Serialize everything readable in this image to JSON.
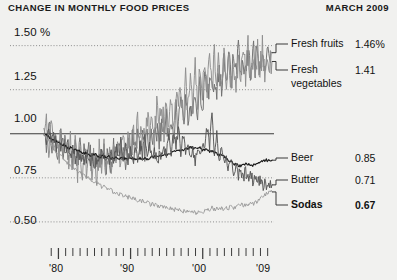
{
  "header": {
    "title": "CHANGE IN MONTHLY FOOD PRICES",
    "date": "MARCH 2009"
  },
  "chart_data": {
    "type": "line",
    "title": "CHANGE IN MONTHLY FOOD PRICES",
    "subtitle": "MARCH 2009",
    "xlabel": "",
    "ylabel": "",
    "grid": true,
    "legend_position": "right",
    "ylim": [
      0.42,
      1.6
    ],
    "yticks": [
      1.5,
      1.25,
      1.0,
      0.75,
      0.5
    ],
    "ytick_labels": [
      "1.50 %",
      "1.25",
      "1.00",
      "0.75",
      "0.50"
    ],
    "xlim": [
      1978,
      2009.6
    ],
    "xticks": [
      1980,
      1990,
      2000,
      2009
    ],
    "xtick_labels": [
      "'80",
      "'90",
      "'00",
      "'09"
    ],
    "baseline": 1.0,
    "series": [
      {
        "name": "Fresh fruits",
        "end_label": "1.46%",
        "end_value": 1.46,
        "color": "#6f6f6f",
        "values": [
          1.03,
          0.96,
          1.04,
          0.92,
          1.0,
          0.93,
          0.86,
          0.97,
          0.88,
          0.95,
          0.86,
          0.93,
          0.86,
          0.93,
          0.85,
          0.92,
          0.84,
          0.91,
          0.83,
          0.9,
          0.82,
          0.89,
          0.81,
          0.88,
          0.83,
          0.9,
          0.82,
          0.89,
          0.83,
          0.92,
          0.84,
          0.93,
          0.85,
          0.94,
          0.86,
          0.95,
          0.87,
          0.96,
          0.88,
          0.97,
          0.9,
          0.99,
          0.91,
          1.0,
          0.93,
          1.02,
          0.94,
          1.03,
          0.96,
          1.05,
          0.98,
          1.07,
          1.0,
          1.1,
          1.02,
          1.12,
          1.05,
          1.15,
          1.07,
          1.17,
          1.1,
          1.2,
          1.12,
          1.23,
          1.15,
          1.26,
          1.17,
          1.29,
          1.19,
          1.31,
          1.22,
          1.34,
          1.24,
          1.37,
          1.27,
          1.4,
          1.29,
          1.43,
          1.32,
          1.45,
          1.34,
          1.47,
          1.3,
          1.44,
          1.33,
          1.46,
          1.36,
          1.5,
          1.38,
          1.52,
          1.35,
          1.48,
          1.38,
          1.51,
          1.41,
          1.46
        ]
      },
      {
        "name": "Fresh vegetables",
        "end_label": "1.41",
        "end_value": 1.41,
        "color": "#8e8e8e",
        "values": [
          0.99,
          1.09,
          0.94,
          1.05,
          0.91,
          1.02,
          0.88,
          0.99,
          0.85,
          0.97,
          0.83,
          0.94,
          0.81,
          0.92,
          0.8,
          0.91,
          0.79,
          0.9,
          0.78,
          0.89,
          0.77,
          0.88,
          0.78,
          0.9,
          0.79,
          0.92,
          0.8,
          0.93,
          0.82,
          0.95,
          0.83,
          0.97,
          0.85,
          0.99,
          0.86,
          1.01,
          0.88,
          1.03,
          0.9,
          1.05,
          0.92,
          1.07,
          0.94,
          1.1,
          0.96,
          1.12,
          0.98,
          1.15,
          1.0,
          1.18,
          1.02,
          1.2,
          1.05,
          1.23,
          1.07,
          1.26,
          1.09,
          1.28,
          1.12,
          1.31,
          1.14,
          1.34,
          1.16,
          1.36,
          1.18,
          1.38,
          1.2,
          1.4,
          1.22,
          1.42,
          1.24,
          1.44,
          1.26,
          1.45,
          1.27,
          1.46,
          1.28,
          1.47,
          1.25,
          1.43,
          1.28,
          1.45,
          1.3,
          1.47,
          1.32,
          1.49,
          1.29,
          1.44,
          1.32,
          1.46,
          1.34,
          1.48,
          1.36,
          1.44,
          1.38,
          1.41
        ]
      },
      {
        "name": "Beer",
        "end_label": "0.85",
        "end_value": 0.85,
        "color": "#1c1c1c",
        "values": [
          1.0,
          0.99,
          0.98,
          0.97,
          0.96,
          0.96,
          0.95,
          0.94,
          0.94,
          0.93,
          0.92,
          0.92,
          0.91,
          0.91,
          0.9,
          0.9,
          0.89,
          0.89,
          0.89,
          0.88,
          0.88,
          0.88,
          0.88,
          0.87,
          0.87,
          0.87,
          0.87,
          0.87,
          0.86,
          0.86,
          0.86,
          0.86,
          0.86,
          0.86,
          0.86,
          0.86,
          0.86,
          0.86,
          0.86,
          0.86,
          0.86,
          0.86,
          0.86,
          0.86,
          0.86,
          0.87,
          0.87,
          0.87,
          0.87,
          0.88,
          0.88,
          0.88,
          0.89,
          0.89,
          0.9,
          0.9,
          0.9,
          0.91,
          0.91,
          0.91,
          0.92,
          0.92,
          0.92,
          0.92,
          0.92,
          0.92,
          0.91,
          0.91,
          0.91,
          0.9,
          0.9,
          0.89,
          0.89,
          0.88,
          0.88,
          0.87,
          0.86,
          0.85,
          0.84,
          0.83,
          0.83,
          0.82,
          0.82,
          0.82,
          0.83,
          0.83,
          0.82,
          0.82,
          0.83,
          0.83,
          0.84,
          0.84,
          0.85,
          0.85,
          0.85,
          0.85
        ]
      },
      {
        "name": "Butter",
        "end_label": "0.71",
        "end_value": 0.71,
        "color": "#555555",
        "values": [
          1.0,
          0.97,
          1.02,
          0.95,
          1.0,
          0.93,
          0.98,
          0.91,
          0.96,
          0.89,
          0.94,
          0.88,
          0.92,
          0.86,
          0.9,
          0.85,
          0.89,
          0.84,
          0.88,
          0.83,
          0.87,
          0.82,
          0.86,
          0.84,
          0.9,
          0.84,
          0.89,
          0.83,
          0.88,
          0.86,
          0.93,
          0.87,
          0.95,
          0.86,
          0.93,
          0.85,
          0.91,
          0.84,
          0.9,
          0.86,
          0.94,
          0.88,
          0.98,
          0.86,
          0.93,
          0.85,
          0.9,
          0.84,
          0.88,
          0.86,
          0.92,
          0.88,
          0.97,
          0.9,
          1.01,
          0.92,
          1.04,
          0.9,
          0.99,
          0.88,
          0.95,
          0.86,
          0.92,
          0.85,
          0.9,
          0.87,
          0.96,
          0.91,
          1.04,
          0.94,
          1.1,
          0.9,
          1.0,
          0.86,
          0.92,
          0.83,
          0.87,
          0.8,
          0.84,
          0.78,
          0.82,
          0.76,
          0.8,
          0.75,
          0.79,
          0.74,
          0.78,
          0.73,
          0.77,
          0.71,
          0.75,
          0.7,
          0.73,
          0.69,
          0.72,
          0.71
        ]
      },
      {
        "name": "Sodas",
        "end_label": "0.67",
        "end_value": 0.67,
        "color": "#9a9a9a",
        "bold": true,
        "values": [
          1.0,
          0.98,
          0.96,
          0.94,
          0.92,
          0.9,
          0.89,
          0.87,
          0.86,
          0.85,
          0.83,
          0.82,
          0.81,
          0.8,
          0.79,
          0.78,
          0.77,
          0.76,
          0.75,
          0.74,
          0.73,
          0.72,
          0.72,
          0.71,
          0.7,
          0.7,
          0.69,
          0.68,
          0.68,
          0.67,
          0.67,
          0.66,
          0.66,
          0.65,
          0.65,
          0.64,
          0.64,
          0.63,
          0.63,
          0.62,
          0.62,
          0.62,
          0.61,
          0.61,
          0.6,
          0.6,
          0.6,
          0.59,
          0.59,
          0.59,
          0.58,
          0.58,
          0.58,
          0.58,
          0.57,
          0.57,
          0.57,
          0.57,
          0.56,
          0.56,
          0.56,
          0.56,
          0.56,
          0.55,
          0.55,
          0.56,
          0.56,
          0.56,
          0.57,
          0.57,
          0.58,
          0.57,
          0.58,
          0.57,
          0.58,
          0.57,
          0.58,
          0.58,
          0.59,
          0.58,
          0.59,
          0.59,
          0.6,
          0.59,
          0.6,
          0.6,
          0.61,
          0.6,
          0.61,
          0.62,
          0.63,
          0.64,
          0.65,
          0.66,
          0.67,
          0.67
        ]
      }
    ]
  },
  "yaxis": {
    "labels": [
      {
        "text": "1.50 %",
        "value": 1.5
      },
      {
        "text": "1.25",
        "value": 1.25
      },
      {
        "text": "1.00",
        "value": 1.0
      },
      {
        "text": "0.75",
        "value": 0.75
      },
      {
        "text": "0.50",
        "value": 0.5
      }
    ]
  },
  "xaxis": {
    "labels": [
      {
        "text": "'80",
        "value": 1980
      },
      {
        "text": "'90",
        "value": 1990
      },
      {
        "text": "'00",
        "value": 2000
      },
      {
        "text": "'09",
        "value": 2009
      }
    ]
  },
  "legend": {
    "entries": [
      {
        "name": "Fresh fruits",
        "value": "1.46%",
        "bold": false
      },
      {
        "name": "Fresh",
        "name2": "vegetables",
        "value": "1.41",
        "bold": false
      },
      {
        "name": "Beer",
        "value": "0.85",
        "bold": false
      },
      {
        "name": "Butter",
        "value": "0.71",
        "bold": false
      },
      {
        "name": "Sodas",
        "value": "0.67",
        "bold": true
      }
    ]
  },
  "colors": {
    "background": "#f1f1ef",
    "text": "#161616",
    "grid": "#8d8d8d",
    "baseline": "#3a3a3a"
  }
}
